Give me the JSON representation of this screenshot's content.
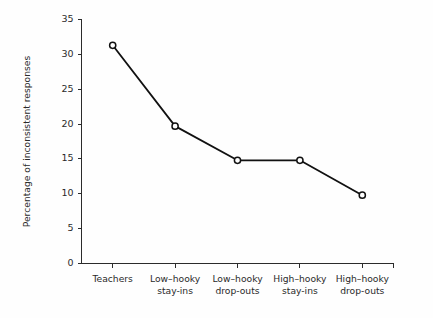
{
  "chart_data": {
    "type": "line",
    "title": "",
    "subtitle": "",
    "xlabel": "",
    "ylabel": "Percentage of inconsistent responses",
    "categories": [
      "Teachers",
      "Low–hooky stay-ins",
      "Low–hooky drop-outs",
      "High–hooky stay-ins",
      "High–hooky drop-outs"
    ],
    "category_lines": [
      [
        "Teachers",
        ""
      ],
      [
        "Low–hooky",
        "stay-ins"
      ],
      [
        "Low–hooky",
        "drop-outs"
      ],
      [
        "High–hooky",
        "stay-ins"
      ],
      [
        "High–hooky",
        "drop-outs"
      ]
    ],
    "values": [
      31.3,
      19.7,
      14.8,
      14.8,
      9.8
    ],
    "ylim": [
      0,
      35
    ],
    "ytick_labels": [
      "0",
      "5",
      "10",
      "15",
      "20",
      "25",
      "30",
      "35"
    ],
    "ytick_values": [
      0,
      5,
      10,
      15,
      20,
      25,
      30,
      35
    ],
    "grid": false,
    "legend": false,
    "legend_position": "none",
    "marker": "open-circle",
    "line_color": "#111111",
    "marker_fill_color": "#fefefe",
    "axis_color": "#2b2b2b",
    "background_color": "#fefefe"
  }
}
